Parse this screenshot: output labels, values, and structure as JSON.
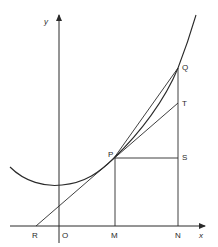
{
  "diagram": {
    "type": "tangent-chord-construction",
    "axes": {
      "x_label": "x",
      "y_label": "y",
      "origin_label": "O"
    },
    "points": {
      "P": {
        "label": "P",
        "description": "point on curve where tangent touches"
      },
      "Q": {
        "label": "Q",
        "description": "second point on curve"
      },
      "T": {
        "label": "T",
        "description": "tangent meets vertical line QN"
      },
      "S": {
        "label": "S",
        "description": "horizontal from P meets QN"
      },
      "R": {
        "label": "R",
        "description": "tangent meets x-axis"
      },
      "M": {
        "label": "M",
        "description": "foot of perpendicular from P"
      },
      "N": {
        "label": "N",
        "description": "foot of perpendicular from Q"
      }
    },
    "elements": [
      "curve (convex, minimum near y-axis)",
      "tangent line R-P-T",
      "chord P-Q",
      "vertical PM",
      "vertical QN through T and S",
      "horizontal PS"
    ],
    "stroke_color": "#2a2a2a"
  }
}
